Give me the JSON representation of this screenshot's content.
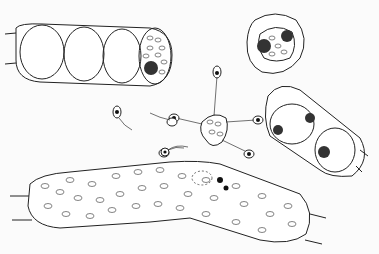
{
  "image": {
    "description": "Hand-drawn pen illustration of filamentous green algae cells, zoospores with flagella, and a germinating zoospore cluster",
    "elements": [
      {
        "name": "filament-upper-left",
        "note": "cylindrical filament with three empty cells and one cell containing chloroplasts and nucleus"
      },
      {
        "name": "isolated-cell-top-right",
        "note": "round cell with chloroplast mass and two dark nuclei"
      },
      {
        "name": "zoospore-cluster-center",
        "note": "central body with four radiating zoospores on stalks"
      },
      {
        "name": "free-zoospores",
        "note": "small ovoid swimmers with dark nucleus and long flagellum"
      },
      {
        "name": "dividing-cell-right",
        "note": "two-celled segment with dividing nuclei"
      },
      {
        "name": "filament-bottom",
        "note": "long bent filament packed with chloroplasts, zoospore attached at top"
      }
    ]
  }
}
